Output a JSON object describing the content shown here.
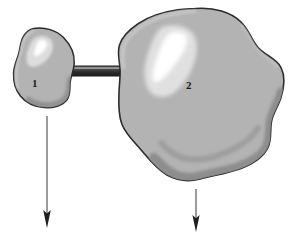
{
  "figure": {
    "kind": "grayscale-anatomical-blob-diagram",
    "background_color": "#ffffff",
    "width": 288,
    "height": 239
  },
  "palette": {
    "page_background": "#ffffff",
    "blob_fill": "#b3b3b3",
    "blob_fill_light": "#bdbdbd",
    "blob_outline": "#2b2b2b",
    "blob_rim_light": "#c9c9c9",
    "blob_shadow_band": "#8d8d8d",
    "highlight_pale": "#e2e2e2",
    "highlight_bright": "#ffffff",
    "rod_dark": "#3a3a3a",
    "rod_darkest": "#242424",
    "rod_highlight": "#7c7c7c",
    "arrow_stroke": "#4a4a4a",
    "arrowhead_fill": "#1f1f1f",
    "label_color": "#1a1a1a"
  },
  "bodies": [
    {
      "id": "body-1",
      "label": "1",
      "name": "small-mass",
      "label_x": 35,
      "label_y": 86,
      "bounds": {
        "x": 12,
        "y": 27,
        "width": 64,
        "height": 82
      },
      "has_highlight": true,
      "has_shadow_band": true
    },
    {
      "id": "body-2",
      "label": "2",
      "name": "large-mass",
      "label_x": 189,
      "label_y": 88,
      "bounds": {
        "x": 117,
        "y": 7,
        "width": 169,
        "height": 174
      },
      "has_highlight": true,
      "has_shadow_band": true
    }
  ],
  "connector": {
    "id": "connector-rod",
    "name": "connecting-rod",
    "x1": 65,
    "x2": 141,
    "y_center": 71,
    "thickness": 10,
    "style": "dark rounded-end bar with pale top highlight"
  },
  "arrows": [
    {
      "id": "arrow-1",
      "name": "downward-arrow-left",
      "x": 47,
      "y_start": 116,
      "y_end": 226,
      "direction": "down",
      "points_from": "1"
    },
    {
      "id": "arrow-2",
      "name": "downward-arrow-right",
      "x": 196,
      "y_start": 189,
      "y_end": 231,
      "direction": "down",
      "points_from": "2"
    }
  ],
  "labels": {
    "body_one": "1",
    "body_two": "2"
  }
}
